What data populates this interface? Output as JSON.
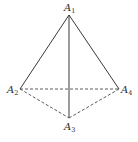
{
  "diagram": {
    "type": "tetrahedron",
    "vertices": [
      {
        "id": "A1",
        "letter": "A",
        "sub": "1"
      },
      {
        "id": "A2",
        "letter": "A",
        "sub": "2"
      },
      {
        "id": "A3",
        "letter": "A",
        "sub": "3"
      },
      {
        "id": "A4",
        "letter": "A",
        "sub": "4"
      }
    ],
    "edges": [
      {
        "from": "A1",
        "to": "A2",
        "style": "solid"
      },
      {
        "from": "A1",
        "to": "A4",
        "style": "solid"
      },
      {
        "from": "A1",
        "to": "A3",
        "style": "solid"
      },
      {
        "from": "A2",
        "to": "A4",
        "style": "dashed"
      },
      {
        "from": "A2",
        "to": "A3",
        "style": "dashed"
      },
      {
        "from": "A3",
        "to": "A4",
        "style": "dashed"
      }
    ]
  }
}
